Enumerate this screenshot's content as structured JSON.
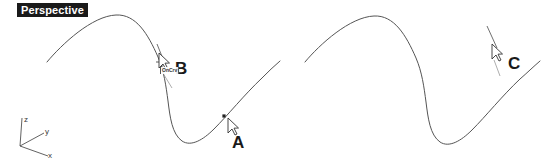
{
  "viewport": {
    "title": "Perspective",
    "background_color": "#ffffff",
    "curve_color": "#555555",
    "title_bg_color": "#1a1a1a",
    "title_text_color": "#ffffff",
    "label_color": "#1a1a1a",
    "width": 551,
    "height": 161
  },
  "axis_gizmo": {
    "origin": {
      "x": 20,
      "y": 146
    },
    "axes": [
      {
        "name": "z-axis",
        "label": "z",
        "end_x": 22,
        "end_y": 118,
        "label_x": 24,
        "label_y": 116
      },
      {
        "name": "y-axis",
        "label": "y",
        "end_x": 44,
        "end_y": 133,
        "label_x": 45,
        "label_y": 128
      },
      {
        "name": "x-axis",
        "label": "x",
        "end_x": 48,
        "end_y": 156,
        "label_x": 48,
        "label_y": 152
      }
    ]
  },
  "markers": [
    {
      "id": "A",
      "label": "A",
      "label_x": 232,
      "label_y": 134,
      "cursor_x": 228,
      "cursor_y": 118,
      "point_x": 224,
      "point_y": 116,
      "has_point_dot": true,
      "has_osnap_tip": false,
      "osnap_tip": ""
    },
    {
      "id": "B",
      "label": "B",
      "label_x": 175,
      "label_y": 60,
      "cursor_x": 159,
      "cursor_y": 53,
      "point_x": 162,
      "point_y": 62,
      "has_point_dot": true,
      "has_osnap_tip": true,
      "osnap_tip": "OnCrv"
    },
    {
      "id": "C",
      "label": "C",
      "label_x": 508,
      "label_y": 55,
      "cursor_x": 492,
      "cursor_y": 44,
      "point_x": 495,
      "point_y": 56,
      "has_point_dot": false,
      "has_osnap_tip": false,
      "osnap_tip": ""
    }
  ],
  "curves": [
    {
      "name": "left-curve",
      "path": "M 47 62 C 62 44, 92 16, 116 15 C 136 14, 148 34, 158 57 C 164 71, 166 86, 168 101 C 170 117, 172 134, 182 141 C 191 147, 203 140, 214 129 C 228 115, 244 95, 262 78 C 268 72, 274 66, 280 61"
    },
    {
      "name": "right-curve",
      "path": "M 305 62 C 320 44, 350 17, 374 16 C 394 15, 406 35, 416 58 C 422 72, 424 87, 426 102 C 428 118, 430 135, 440 142 C 449 148, 461 141, 472 130 C 486 116, 502 96, 520 79 C 527 73, 533 67, 540 61"
    }
  ],
  "drag_lines": [
    {
      "name": "drag-line-b-upper",
      "x1": 157,
      "y1": 44,
      "x2": 163,
      "y2": 59
    },
    {
      "name": "drag-line-b-lower",
      "x1": 161,
      "y1": 70,
      "x2": 172,
      "y2": 88
    },
    {
      "name": "drag-line-c-upper",
      "x1": 487,
      "y1": 26,
      "x2": 497,
      "y2": 48
    },
    {
      "name": "drag-line-c-lower",
      "x1": 494,
      "y1": 60,
      "x2": 500,
      "y2": 76
    }
  ]
}
